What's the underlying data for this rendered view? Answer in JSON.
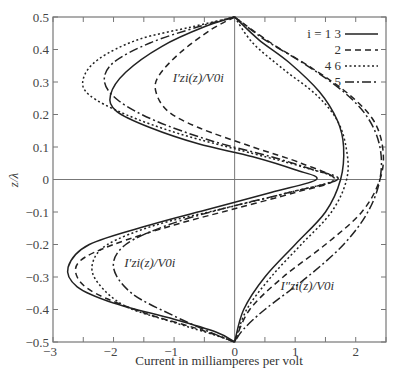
{
  "chart_data": {
    "type": "line",
    "title": "",
    "xlabel": "Current in milliamperes per volt",
    "ylabel": "z/λ",
    "xlim": [
      -3,
      2.5
    ],
    "ylim": [
      -0.5,
      0.5
    ],
    "x_ticks": [
      "-3",
      "-2",
      "-1",
      "0",
      "1",
      "2"
    ],
    "y_ticks": [
      "0.5",
      "0.4",
      "0.3",
      "0.2",
      "0.1",
      "0",
      "-0.1",
      "-0.2",
      "-0.3",
      "-0.4",
      "-0.5"
    ],
    "grid": false,
    "legend_position": "upper right",
    "legend": [
      {
        "label": "i = 1  3",
        "style": "solid"
      },
      {
        "label": "2",
        "style": "dashed"
      },
      {
        "label": "4  6",
        "style": "dotted"
      },
      {
        "label": "5",
        "style": "dashdot"
      }
    ],
    "annotations": [
      {
        "text": "I′zi(z)/V0i",
        "x": -0.6,
        "y": 0.3
      },
      {
        "text": "I′zi(z)/V0i",
        "x": -1.4,
        "y": -0.27
      },
      {
        "text": "I″zi(z)/V0i",
        "x": 1.2,
        "y": -0.34
      }
    ],
    "series": [
      {
        "name": "i = 1, 3 (I′)",
        "style": "solid",
        "x": [
          0,
          -0.5,
          -1.2,
          -1.8,
          -2.05,
          -1.95,
          -1.4,
          -0.6,
          0.3,
          1.0,
          1.35,
          0.6,
          -0.4,
          -1.4,
          -2.4,
          -2.75,
          -2.6,
          -2.0,
          -1.0,
          -0.3,
          0
        ],
        "y": [
          0.5,
          0.47,
          0.41,
          0.33,
          0.26,
          0.21,
          0.16,
          0.11,
          0.07,
          0.03,
          0,
          -0.04,
          -0.09,
          -0.14,
          -0.2,
          -0.27,
          -0.33,
          -0.38,
          -0.43,
          -0.47,
          -0.5
        ]
      },
      {
        "name": "i = 2 (I′)",
        "style": "dashed",
        "x": [
          0,
          -0.4,
          -0.9,
          -1.25,
          -1.3,
          -1.1,
          -0.6,
          0.3,
          1.1,
          1.65,
          1.0,
          0.0,
          -1.0,
          -2.0,
          -2.55,
          -2.6,
          -2.3,
          -1.5,
          -0.6,
          0
        ],
        "y": [
          0.5,
          0.46,
          0.39,
          0.32,
          0.27,
          0.21,
          0.16,
          0.1,
          0.05,
          0,
          -0.04,
          -0.09,
          -0.14,
          -0.2,
          -0.25,
          -0.3,
          -0.35,
          -0.41,
          -0.46,
          -0.5
        ]
      },
      {
        "name": "i = 4, 6 (I′)",
        "style": "dotted",
        "x": [
          0,
          -0.7,
          -1.6,
          -2.25,
          -2.5,
          -2.4,
          -1.8,
          -0.9,
          0.3,
          1.1,
          1.65,
          0.9,
          -0.2,
          -1.3,
          -2.1,
          -2.35,
          -2.25,
          -1.8,
          -1.0,
          -0.3,
          0
        ],
        "y": [
          0.5,
          0.47,
          0.43,
          0.37,
          0.31,
          0.26,
          0.2,
          0.14,
          0.08,
          0.04,
          0,
          -0.04,
          -0.09,
          -0.14,
          -0.2,
          -0.26,
          -0.32,
          -0.39,
          -0.44,
          -0.48,
          -0.5
        ]
      },
      {
        "name": "i = 5 (I′)",
        "style": "dashdot",
        "x": [
          0,
          -0.6,
          -1.4,
          -2.0,
          -2.15,
          -1.9,
          -1.3,
          -0.4,
          0.6,
          1.3,
          1.7,
          0.9,
          -0.2,
          -1.1,
          -1.8,
          -2.0,
          -1.7,
          -1.0,
          -0.4,
          0
        ],
        "y": [
          0.5,
          0.47,
          0.42,
          0.36,
          0.3,
          0.24,
          0.18,
          0.12,
          0.07,
          0.03,
          0,
          -0.04,
          -0.09,
          -0.14,
          -0.2,
          -0.27,
          -0.35,
          -0.42,
          -0.47,
          -0.5
        ]
      },
      {
        "name": "i = 1, 3 (I″)",
        "style": "solid",
        "x": [
          0,
          0.4,
          0.9,
          1.4,
          1.7,
          1.8,
          1.75,
          1.5,
          1.0,
          0.5,
          0.15,
          0
        ],
        "y": [
          0.5,
          0.43,
          0.36,
          0.27,
          0.18,
          0.1,
          0,
          -0.1,
          -0.2,
          -0.3,
          -0.4,
          -0.5
        ]
      },
      {
        "name": "i = 2 (I″)",
        "style": "dashed",
        "x": [
          0,
          0.6,
          1.3,
          1.9,
          2.3,
          2.45,
          2.4,
          2.1,
          1.5,
          0.8,
          0.25,
          0
        ],
        "y": [
          0.5,
          0.42,
          0.34,
          0.26,
          0.18,
          0.09,
          0,
          -0.1,
          -0.2,
          -0.3,
          -0.4,
          -0.5
        ]
      },
      {
        "name": "i = 4, 6 (I″)",
        "style": "dotted",
        "x": [
          0,
          0.3,
          0.8,
          1.35,
          1.7,
          1.85,
          1.85,
          1.6,
          1.1,
          0.6,
          0.2,
          0
        ],
        "y": [
          0.5,
          0.42,
          0.34,
          0.26,
          0.18,
          0.09,
          0,
          -0.1,
          -0.2,
          -0.3,
          -0.4,
          -0.5
        ]
      },
      {
        "name": "i = 5 (I″)",
        "style": "dashdot",
        "x": [
          0,
          0.5,
          1.2,
          1.8,
          2.2,
          2.4,
          2.4,
          2.2,
          1.8,
          1.2,
          0.5,
          0.15,
          0
        ],
        "y": [
          0.5,
          0.43,
          0.35,
          0.27,
          0.19,
          0.1,
          0,
          -0.1,
          -0.2,
          -0.3,
          -0.4,
          -0.46,
          -0.5
        ]
      }
    ]
  }
}
